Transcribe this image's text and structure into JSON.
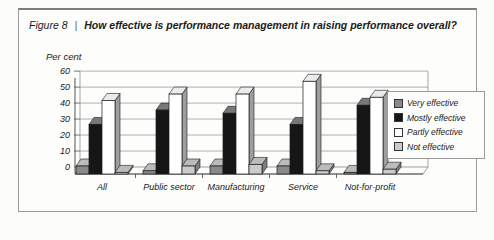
{
  "figure": {
    "label": "Figure 8",
    "separator": "|",
    "title": "How effective is performance management in raising performance overall?"
  },
  "chart_data": {
    "type": "bar",
    "subtype": "3d-clustered-column",
    "title": "How effective is performance management in raising performance overall?",
    "ylabel": "Per cent",
    "xlabel": "",
    "ylim": [
      0,
      60
    ],
    "yticks": [
      0,
      10,
      20,
      30,
      40,
      50,
      60
    ],
    "grid": true,
    "legend_position": "right",
    "categories": [
      "All",
      "Public sector",
      "Manufacturing",
      "Service",
      "Not-for-profit"
    ],
    "series": [
      {
        "name": "Very effective",
        "color": "#8a8a8a",
        "values": [
          5,
          2,
          5,
          5,
          1
        ]
      },
      {
        "name": "Mostly effective",
        "color": "#161616",
        "values": [
          31,
          40,
          38,
          31,
          43
        ]
      },
      {
        "name": "Partly effective",
        "color": "#ffffff",
        "values": [
          46,
          50,
          50,
          58,
          48
        ]
      },
      {
        "name": "Not effective",
        "color": "#cbcbcb",
        "values": [
          1,
          5,
          6,
          2,
          3
        ]
      }
    ]
  }
}
